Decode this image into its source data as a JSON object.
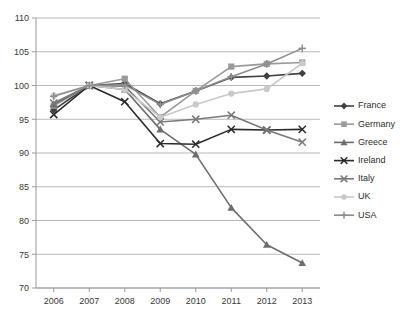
{
  "chart_data": {
    "type": "line",
    "title": "",
    "xlabel": "",
    "ylabel": "",
    "categories": [
      "2006",
      "2007",
      "2008",
      "2009",
      "2010",
      "2011",
      "2012",
      "2013"
    ],
    "x_tick_labels": [
      "2006",
      "2007",
      "2008",
      "2009",
      "2010",
      "2011",
      "2012",
      "2013"
    ],
    "y_tick_labels": [
      "70",
      "75",
      "80",
      "85",
      "90",
      "95",
      "100",
      "105",
      "110"
    ],
    "y_ticks": [
      70,
      75,
      80,
      85,
      90,
      95,
      100,
      105,
      110
    ],
    "ylim": [
      70,
      110
    ],
    "grid": "horizontal",
    "legend_position": "right",
    "series": [
      {
        "name": "France",
        "color": "#404040",
        "marker": "diamond",
        "values": [
          96.4,
          100.0,
          100.3,
          97.3,
          99.2,
          101.2,
          101.4,
          101.8
        ]
      },
      {
        "name": "Germany",
        "color": "#9a9a9a",
        "marker": "square",
        "values": [
          97.0,
          100.0,
          101.0,
          95.3,
          99.2,
          102.8,
          103.2,
          103.4
        ]
      },
      {
        "name": "Greece",
        "color": "#6e6e6e",
        "marker": "triangle",
        "values": [
          97.2,
          100.0,
          99.4,
          93.5,
          89.8,
          81.9,
          76.4,
          73.7
        ]
      },
      {
        "name": "Ireland",
        "color": "#2b2b2b",
        "marker": "cross",
        "values": [
          95.7,
          100.0,
          97.6,
          91.4,
          91.3,
          93.5,
          93.4,
          93.5
        ]
      },
      {
        "name": "Italy",
        "color": "#7a7a7a",
        "marker": "cross",
        "values": [
          97.4,
          100.0,
          99.9,
          94.6,
          95.0,
          95.6,
          93.4,
          91.6
        ]
      },
      {
        "name": "UK",
        "color": "#c9c9c9",
        "marker": "circle",
        "values": [
          98.5,
          100.0,
          99.4,
          95.3,
          97.2,
          98.8,
          99.5,
          103.3
        ]
      },
      {
        "name": "USA",
        "color": "#8e8e8e",
        "marker": "plus",
        "values": [
          98.4,
          100.0,
          100.1,
          97.2,
          99.2,
          101.3,
          103.2,
          105.5
        ]
      }
    ]
  }
}
